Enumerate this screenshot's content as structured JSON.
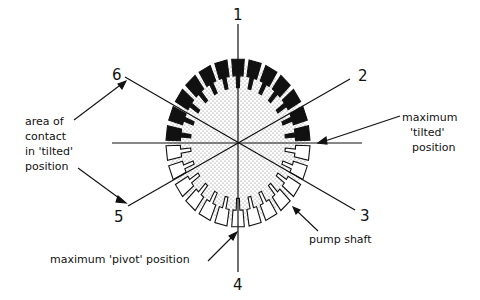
{
  "diagram": {
    "axis_labels": {
      "n1": "1",
      "n2": "2",
      "n3": "3",
      "n4": "4",
      "n5": "5",
      "n6": "6"
    },
    "annotations": {
      "area_of_contact": [
        "area of",
        "contact",
        "in 'tilted'",
        "position"
      ],
      "max_tilted": [
        "maximum",
        "'tilted'",
        "position"
      ],
      "pump_shaft": "pump shaft",
      "max_pivot": "maximum 'pivot' position"
    },
    "segment_count": 26,
    "colors": {
      "ink": "#111111",
      "stipple": "#9a9a9a"
    }
  }
}
